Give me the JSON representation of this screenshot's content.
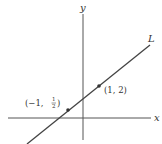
{
  "diagram": {
    "type": "coordinate-plane-line",
    "axes": {
      "x_label": "x",
      "y_label": "y"
    },
    "line": {
      "label": "L",
      "color": "#444444"
    },
    "points": [
      {
        "label": "(1, 2)",
        "x": 1,
        "y": 2
      },
      {
        "label_prefix": "(−1, ",
        "frac_num": "1",
        "frac_den": "2",
        "label_suffix": ")",
        "x": -1,
        "y": 0.5
      }
    ],
    "colors": {
      "axis": "#555555",
      "line": "#444444",
      "point": "#333333",
      "text": "#333333",
      "background": "#ffffff"
    }
  }
}
